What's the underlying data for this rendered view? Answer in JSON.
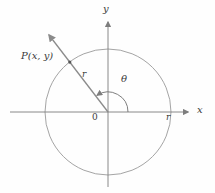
{
  "figure": {
    "labels": {
      "y_axis": "y",
      "x_axis": "x",
      "point": "P(x, y)",
      "radius_on_ray": "r",
      "angle": "θ",
      "origin": "0",
      "radius_on_x_axis": "r"
    },
    "colors": {
      "line": "#8b8b8b",
      "axis": "#7d7d7d",
      "text": "#3a3a3a",
      "background": "#fefefe"
    }
  }
}
